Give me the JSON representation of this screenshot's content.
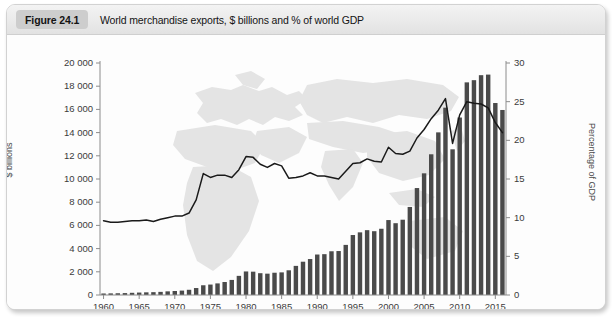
{
  "figure": {
    "badge": "Figure 24.1",
    "title": "World merchandise exports, $ billions and % of world GDP"
  },
  "chart_data": {
    "type": "bar",
    "title": "World merchandise exports, $ billions and % of world GDP",
    "xlabel": "",
    "ylabel": "$ billions",
    "y2label": "Percentage of GDP",
    "ylim": [
      0,
      20000
    ],
    "y2lim": [
      0,
      30
    ],
    "xlim": [
      1960,
      2016
    ],
    "grid": false,
    "legend": "none",
    "background_watermark": "world-map",
    "yticks": [
      0,
      2000,
      4000,
      6000,
      8000,
      10000,
      12000,
      14000,
      16000,
      18000,
      20000
    ],
    "ytick_labels": [
      "0",
      "2 000",
      "4 000",
      "6 000",
      "8 000",
      "10 000",
      "12 000",
      "14 000",
      "16 000",
      "18 000",
      "20 000"
    ],
    "y2ticks": [
      0,
      5,
      10,
      15,
      20,
      25,
      30
    ],
    "y2tick_labels": [
      "0",
      "5",
      "10",
      "15",
      "20",
      "25",
      "30"
    ],
    "xticks": [
      1960,
      1965,
      1970,
      1975,
      1980,
      1985,
      1990,
      1995,
      2000,
      2005,
      2010,
      2015
    ],
    "xtick_labels": [
      "1960",
      "1965",
      "1970",
      "1975",
      "1980",
      "1985",
      "1990",
      "1995",
      "2000",
      "2005",
      "2010",
      "2015"
    ],
    "x": [
      1960,
      1961,
      1962,
      1963,
      1964,
      1965,
      1966,
      1967,
      1968,
      1969,
      1970,
      1971,
      1972,
      1973,
      1974,
      1975,
      1976,
      1977,
      1978,
      1979,
      1980,
      1981,
      1982,
      1983,
      1984,
      1985,
      1986,
      1987,
      1988,
      1989,
      1990,
      1991,
      1992,
      1993,
      1994,
      1995,
      1996,
      1997,
      1998,
      1999,
      2000,
      2001,
      2002,
      2003,
      2004,
      2005,
      2006,
      2007,
      2008,
      2009,
      2010,
      2011,
      2012,
      2013,
      2014,
      2015,
      2016
    ],
    "series": [
      {
        "name": "World merchandise exports",
        "axis": "left",
        "units": "$ billions",
        "render": "bar",
        "color": "#4a4a4a",
        "values": [
          130,
          140,
          150,
          165,
          190,
          210,
          230,
          245,
          270,
          315,
          345,
          380,
          450,
          600,
          840,
          900,
          1000,
          1120,
          1300,
          1650,
          2030,
          2010,
          1880,
          1840,
          1920,
          1950,
          2130,
          2510,
          2870,
          3100,
          3490,
          3520,
          3770,
          3790,
          4320,
          5170,
          5400,
          5590,
          5500,
          5710,
          6460,
          6190,
          6490,
          7590,
          9220,
          10490,
          12130,
          14020,
          16150,
          12560,
          15300,
          18330,
          18520,
          18950,
          19000,
          16550,
          15950
        ]
      },
      {
        "name": "Merchandise exports as % of world GDP",
        "axis": "right",
        "units": "% of GDP",
        "render": "line",
        "color": "#1a1a1a",
        "values": [
          9.6,
          9.4,
          9.4,
          9.5,
          9.6,
          9.6,
          9.7,
          9.5,
          9.8,
          10.0,
          10.2,
          10.2,
          10.6,
          12.3,
          15.7,
          15.2,
          15.5,
          15.5,
          15.2,
          16.2,
          17.9,
          17.8,
          16.9,
          16.5,
          17.0,
          16.7,
          15.1,
          15.2,
          15.4,
          15.8,
          15.4,
          15.4,
          15.2,
          15.0,
          16.0,
          17.0,
          17.1,
          17.6,
          17.3,
          17.2,
          19.1,
          18.3,
          18.2,
          18.6,
          20.3,
          21.4,
          22.8,
          23.9,
          25.4,
          19.6,
          23.3,
          25.0,
          24.8,
          24.7,
          24.2,
          22.3,
          21.0
        ]
      }
    ]
  }
}
